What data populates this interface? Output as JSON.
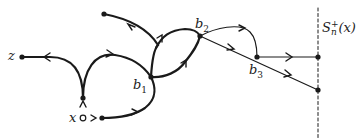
{
  "diagram": {
    "type": "branching-paths",
    "labels": {
      "z": "z",
      "x": "x",
      "b1": {
        "base": "b",
        "sub": "1"
      },
      "b2": {
        "base": "b",
        "sub": "2"
      },
      "b3": {
        "base": "b",
        "sub": "3"
      },
      "sphere": {
        "base": "S",
        "sup": "+",
        "sub": "n",
        "arg": "(x)"
      }
    },
    "colors": {
      "stroke": "#1a1a1a",
      "background": "#ffffff"
    },
    "nodes": [
      {
        "id": "z",
        "x": 22,
        "y": 57
      },
      {
        "id": "x",
        "x": 83,
        "y": 118,
        "open": true
      },
      {
        "id": "above-x",
        "x": 83,
        "y": 98
      },
      {
        "id": "right-x",
        "x": 102,
        "y": 118
      },
      {
        "id": "top-left",
        "x": 104,
        "y": 14
      },
      {
        "id": "b1",
        "x": 151,
        "y": 77
      },
      {
        "id": "b2",
        "x": 200,
        "y": 36
      },
      {
        "id": "b3",
        "x": 257,
        "y": 57
      },
      {
        "id": "end-1",
        "x": 318,
        "y": 57
      },
      {
        "id": "end-2",
        "x": 318,
        "y": 90
      }
    ],
    "boundary": {
      "x": 318,
      "style": "dashed"
    }
  }
}
